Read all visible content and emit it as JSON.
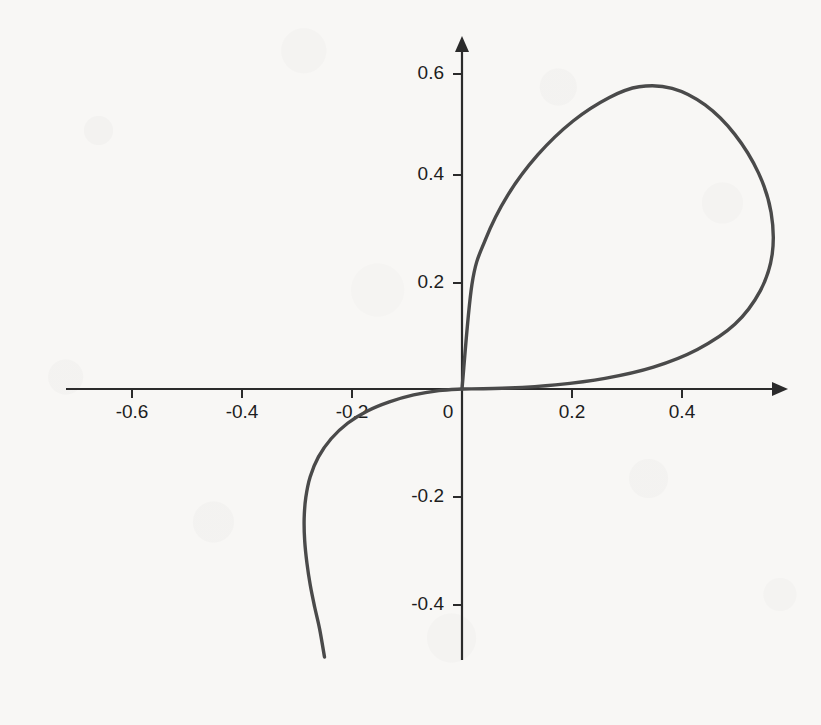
{
  "figure": {
    "background_color": "#f8f7f5",
    "axis_color": "#2b2b2b",
    "curve_color": "#4a4a4a"
  },
  "chart_data": {
    "type": "line",
    "title": "",
    "subtitle": "",
    "xlabel": "",
    "ylabel": "",
    "grid": false,
    "legend": false,
    "legend_position": "none",
    "axes_style": "crossed-arrows-at-origin",
    "xlim": [
      -0.72,
      0.62
    ],
    "ylim": [
      -0.52,
      0.62
    ],
    "xticks": [
      -0.6,
      -0.4,
      -0.2,
      0,
      0.2,
      0.4
    ],
    "yticks": [
      -0.4,
      -0.2,
      0.2,
      0.4,
      0.6
    ],
    "xtick_labels": [
      "-0.6",
      "-0.4",
      "-0.2",
      "0",
      "0.2",
      "0.4"
    ],
    "ytick_labels": [
      "-0.4",
      "-0.2",
      "0.2",
      "0.4",
      "0.6"
    ],
    "origin_label": "0",
    "annotations": [],
    "series": [
      {
        "name": "folium",
        "closed": false,
        "loop_peak": [
          0.32,
          0.565
        ],
        "loop_rightmost": [
          0.565,
          0.33
        ],
        "tail_leftmost": [
          -0.28,
          -0.16
        ],
        "tail_end": [
          -0.25,
          -0.5
        ],
        "points": [
          [
            -0.25,
            -0.501
          ],
          [
            -0.262,
            -0.46
          ],
          [
            -0.272,
            -0.418
          ],
          [
            -0.2795,
            -0.377
          ],
          [
            -0.2845,
            -0.336
          ],
          [
            -0.287,
            -0.296
          ],
          [
            -0.2862,
            -0.256
          ],
          [
            -0.282,
            -0.218
          ],
          [
            -0.2742,
            -0.181
          ],
          [
            -0.263,
            -0.147
          ],
          [
            -0.248,
            -0.116
          ],
          [
            -0.229,
            -0.089
          ],
          [
            -0.2065,
            -0.066
          ],
          [
            -0.181,
            -0.047
          ],
          [
            -0.153,
            -0.032
          ],
          [
            -0.123,
            -0.0205
          ],
          [
            -0.092,
            -0.012
          ],
          [
            -0.061,
            -0.0062
          ],
          [
            -0.031,
            -0.0022
          ],
          [
            0.0,
            0.0
          ],
          [
            0.0062,
            0.061
          ],
          [
            0.012,
            0.092
          ],
          [
            0.0205,
            0.123
          ],
          [
            0.032,
            0.153
          ],
          [
            0.047,
            0.181
          ],
          [
            0.066,
            0.2065
          ],
          [
            0.089,
            0.229
          ],
          [
            0.116,
            0.248
          ],
          [
            0.147,
            0.263
          ],
          [
            0.181,
            0.2742
          ],
          [
            0.218,
            0.282
          ],
          [
            0.256,
            0.2862
          ],
          [
            0.296,
            0.287
          ],
          [
            0.336,
            0.2845
          ],
          [
            0.377,
            0.2795
          ],
          [
            0.418,
            0.272
          ],
          [
            0.46,
            0.262
          ],
          [
            0.501,
            0.25
          ],
          [
            0.533,
            0.236
          ],
          [
            0.556,
            0.218
          ],
          [
            0.5648,
            0.199
          ],
          [
            0.565,
            0.17
          ],
          [
            0.556,
            0.14
          ],
          [
            0.533,
            0.108
          ],
          [
            0.501,
            0.08
          ],
          [
            0.46,
            0.056
          ],
          [
            0.418,
            0.039
          ],
          [
            0.377,
            0.0265
          ],
          [
            0.336,
            0.0175
          ],
          [
            0.296,
            0.011
          ],
          [
            0.256,
            0.0066
          ],
          [
            0.218,
            0.0038
          ],
          [
            0.181,
            0.002
          ],
          [
            0.147,
            0.001
          ],
          [
            0.116,
            0.0004
          ],
          [
            0.089,
            0.0001
          ],
          [
            0.061,
            0.0
          ],
          [
            0.031,
            0.0
          ],
          [
            0.0,
            0.0
          ]
        ]
      }
    ],
    "loop_points": [
      [
        0.0,
        0.0
      ],
      [
        0.018,
        0.195
      ],
      [
        0.042,
        0.278
      ],
      [
        0.083,
        0.362
      ],
      [
        0.138,
        0.438
      ],
      [
        0.202,
        0.501
      ],
      [
        0.268,
        0.545
      ],
      [
        0.322,
        0.565
      ],
      [
        0.382,
        0.562
      ],
      [
        0.442,
        0.531
      ],
      [
        0.496,
        0.476
      ],
      [
        0.539,
        0.404
      ],
      [
        0.562,
        0.33
      ],
      [
        0.564,
        0.252
      ],
      [
        0.542,
        0.183
      ],
      [
        0.496,
        0.121
      ],
      [
        0.428,
        0.074
      ],
      [
        0.348,
        0.041
      ],
      [
        0.26,
        0.02
      ],
      [
        0.17,
        0.0078
      ],
      [
        0.085,
        0.002
      ],
      [
        0.0,
        0.0
      ]
    ],
    "tail_points": [
      [
        0.0,
        0.0
      ],
      [
        -0.042,
        -0.003
      ],
      [
        -0.088,
        -0.011
      ],
      [
        -0.132,
        -0.024
      ],
      [
        -0.172,
        -0.041
      ],
      [
        -0.208,
        -0.064
      ],
      [
        -0.238,
        -0.093
      ],
      [
        -0.261,
        -0.127
      ],
      [
        -0.276,
        -0.164
      ],
      [
        -0.284,
        -0.203
      ],
      [
        -0.287,
        -0.243
      ],
      [
        -0.286,
        -0.284
      ],
      [
        -0.282,
        -0.325
      ],
      [
        -0.276,
        -0.366
      ],
      [
        -0.268,
        -0.407
      ],
      [
        -0.259,
        -0.448
      ],
      [
        -0.25,
        -0.501
      ]
    ]
  }
}
